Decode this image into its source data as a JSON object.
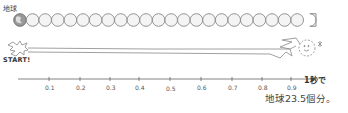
{
  "labels": {
    "earth": "地球",
    "start": "START!",
    "end_line1": "1秒で",
    "end_line2": "地球23.5個分。"
  },
  "axis": {
    "ticks": [
      "0.1",
      "0.2",
      "0.3",
      "0.4",
      "0.5",
      "0.6",
      "0.7",
      "0.8",
      "0.9"
    ]
  },
  "diagram": {
    "earth_count": 23.5,
    "circle_count_drawn": 24
  }
}
